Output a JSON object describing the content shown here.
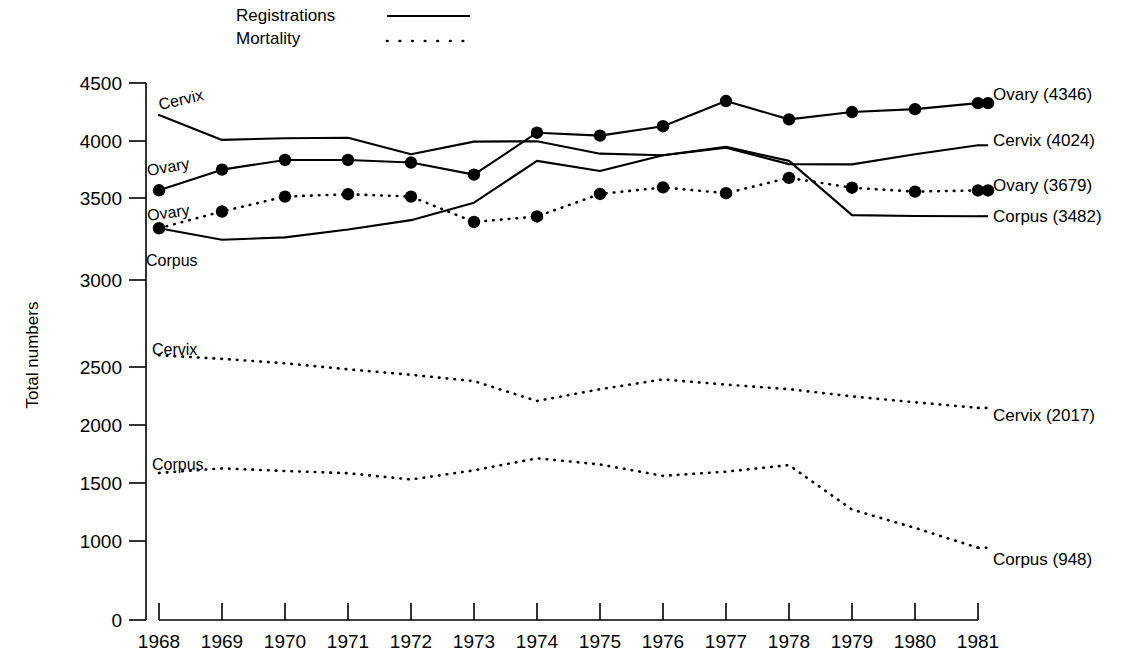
{
  "chart_data": {
    "type": "line",
    "title": "",
    "xlabel": "",
    "ylabel": "Total numbers",
    "x": [
      1968,
      1969,
      1970,
      1971,
      1972,
      1973,
      1974,
      1975,
      1976,
      1977,
      1978,
      1979,
      1980,
      1981
    ],
    "xlim": [
      1968,
      1981
    ],
    "ylim": [
      0,
      4500
    ],
    "yticks": [
      0,
      1000,
      1500,
      2000,
      2500,
      3000,
      3500,
      4000,
      4500
    ],
    "ytick_labels": [
      "0",
      "1000",
      "1500",
      "2000",
      "2500",
      "3000",
      "3500",
      "4000",
      "4500"
    ],
    "xtick_labels": [
      "1968",
      "1969",
      "1970",
      "1971",
      "1972",
      "1973",
      "1974",
      "1975",
      "1976",
      "1977",
      "1978",
      "1979",
      "1980",
      "1981"
    ],
    "grid": false,
    "legend_position": "top",
    "series": [
      {
        "name": "Cervix registrations",
        "label": "Cervix",
        "style": "solid",
        "markers": false,
        "end_label": "Cervix (4024)",
        "end_value": 4024,
        "values": [
          4255,
          4065,
          4078,
          4082,
          3955,
          4052,
          4055,
          3960,
          3948,
          4005,
          3880,
          3878,
          3955,
          4024
        ]
      },
      {
        "name": "Ovary registrations",
        "label": "Ovary",
        "style": "solid",
        "markers": true,
        "end_label": "Ovary (4346)",
        "end_value": 4346,
        "values": [
          3680,
          3838,
          3912,
          3912,
          3892,
          3800,
          4120,
          4098,
          4170,
          4362,
          4222,
          4278,
          4300,
          4346
        ]
      },
      {
        "name": "Corpus registrations",
        "label": "Corpus",
        "style": "solid",
        "markers": false,
        "end_label": "Corpus (3482)",
        "end_value": 3482,
        "values": [
          3390,
          3302,
          3320,
          3380,
          3452,
          3585,
          3905,
          3828,
          3948,
          4012,
          3905,
          3490,
          3484,
          3482
        ]
      },
      {
        "name": "Ovary mortality",
        "label": "Ovary",
        "style": "dotted",
        "markers": true,
        "end_label": "Ovary (3679)",
        "end_value": 3679,
        "values": [
          3390,
          3518,
          3632,
          3650,
          3632,
          3438,
          3480,
          3652,
          3702,
          3658,
          3775,
          3700,
          3670,
          3679
        ]
      },
      {
        "name": "Cervix mortality",
        "label": "Cervix",
        "style": "dotted",
        "markers": false,
        "end_label": "Cervix (2017)",
        "end_value": 2017,
        "values": [
          2420,
          2392,
          2358,
          2312,
          2270,
          2222,
          2070,
          2160,
          2235,
          2195,
          2160,
          2105,
          2060,
          2017
        ]
      },
      {
        "name": "Corpus mortality",
        "label": "Corpus",
        "style": "dotted",
        "markers": false,
        "end_label": "Corpus (948)",
        "end_value": 948,
        "values": [
          1520,
          1555,
          1535,
          1518,
          1470,
          1540,
          1632,
          1585,
          1498,
          1530,
          1580,
          1240,
          1100,
          948
        ]
      }
    ]
  },
  "legend": {
    "items": [
      {
        "label": "Registrations",
        "style": "solid"
      },
      {
        "label": "Mortality",
        "style": "dotted"
      }
    ]
  },
  "axis": {
    "y_title": "Total numbers"
  },
  "inline_labels": [
    {
      "text": "Cervix",
      "id": "cervix-registrations-label"
    },
    {
      "text": "Ovary",
      "id": "ovary-registrations-label"
    },
    {
      "text": "Ovary",
      "id": "ovary-mortality-label"
    },
    {
      "text": "Corpus",
      "id": "corpus-registrations-label"
    },
    {
      "text": "Cervix",
      "id": "cervix-mortality-label"
    },
    {
      "text": "Corpus",
      "id": "corpus-mortality-label"
    }
  ],
  "right_labels": [
    {
      "text": "Ovary (4346)"
    },
    {
      "text": "Cervix (4024)"
    },
    {
      "text": "Ovary (3679)"
    },
    {
      "text": "Corpus (3482)"
    },
    {
      "text": "Cervix (2017)"
    },
    {
      "text": "Corpus (948)"
    }
  ]
}
